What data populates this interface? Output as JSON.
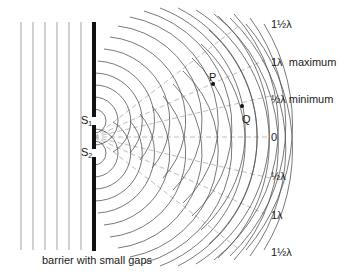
{
  "diagram": {
    "caption": "barrier with small gaps",
    "sources": [
      {
        "label": "S",
        "subscript": "1",
        "x": 94,
        "y": 121
      },
      {
        "label": "S",
        "subscript": "2",
        "x": 94,
        "y": 153
      }
    ],
    "points": [
      {
        "label": "P",
        "x": 213,
        "y": 84
      },
      {
        "label": "Q",
        "x": 242,
        "y": 106
      }
    ],
    "path_difference_labels": [
      {
        "text": "1½λ",
        "position": "top"
      },
      {
        "text": "1λ  maximum",
        "position": "upper"
      },
      {
        "text": "½λ minimum",
        "position": "upper-mid"
      },
      {
        "text": "0",
        "position": "center"
      },
      {
        "text": "½λ",
        "position": "lower-mid"
      },
      {
        "text": "1λ",
        "position": "lower"
      },
      {
        "text": "1½λ",
        "position": "bottom"
      }
    ],
    "plane_wave_count": 6,
    "colors": {
      "barrier": "#111111",
      "wavefront": "#555555",
      "plane_wave": "#8a8a8a",
      "nodal_line": "#b5b5b5",
      "text": "#1a1a1a"
    }
  }
}
